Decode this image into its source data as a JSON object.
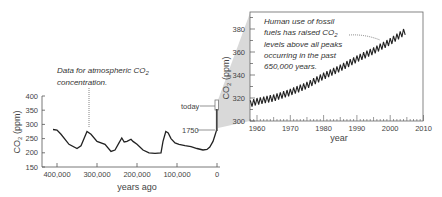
{
  "chart_data": [
    {
      "type": "line",
      "title": "",
      "xlabel": "years ago",
      "ylabel": "CO2 (ppm)",
      "xlim": [
        420000,
        0
      ],
      "ylim": [
        150,
        400
      ],
      "x_ticks": [
        "400,000",
        "300,000",
        "200,000",
        "100,000",
        "0"
      ],
      "y_ticks": [
        "400",
        "350",
        "300",
        "250",
        "200",
        "150"
      ],
      "grid": false,
      "annotation": "Data for atmospheric CO2 concentration.",
      "markers": [
        {
          "label": "today",
          "value": 380
        },
        {
          "label": "1750",
          "value": 280
        }
      ],
      "series": [
        {
          "name": "Atmospheric CO2 (ice core)",
          "x": [
            410000,
            400000,
            390000,
            370000,
            350000,
            340000,
            325000,
            315000,
            300000,
            280000,
            265000,
            255000,
            245000,
            238000,
            232000,
            225000,
            215000,
            210000,
            200000,
            185000,
            170000,
            155000,
            140000,
            135000,
            128000,
            122000,
            115000,
            105000,
            95000,
            80000,
            65000,
            50000,
            35000,
            25000,
            18000,
            10000,
            5000,
            1000,
            0
          ],
          "values": [
            282,
            280,
            265,
            230,
            215,
            225,
            275,
            265,
            240,
            230,
            205,
            210,
            235,
            252,
            238,
            240,
            248,
            240,
            230,
            210,
            200,
            198,
            200,
            240,
            275,
            270,
            250,
            235,
            230,
            225,
            222,
            215,
            210,
            212,
            220,
            240,
            262,
            280,
            280
          ]
        }
      ]
    },
    {
      "type": "line",
      "title": "",
      "xlabel": "year",
      "ylabel": "CO2 (ppm)",
      "xlim": [
        1957,
        2010
      ],
      "ylim": [
        300,
        390
      ],
      "x_ticks": [
        "1960",
        "1970",
        "1980",
        "1990",
        "2000",
        "2010"
      ],
      "y_ticks": [
        "380",
        "360",
        "340",
        "320",
        "300"
      ],
      "grid": false,
      "annotation": "Human use of fossil fuels has raised CO2 levels above all peaks occurring in the past 650,000 years.",
      "series": [
        {
          "name": "Mauna Loa CO2 (seasonal)",
          "x": [
            1958,
            1960,
            1965,
            1970,
            1975,
            1980,
            1985,
            1990,
            1995,
            2000,
            2005
          ],
          "values": [
            315,
            317,
            320,
            325,
            331,
            339,
            346,
            354,
            361,
            369,
            379
          ]
        }
      ]
    }
  ],
  "left_chart": {
    "ylabel": "CO",
    "ylabel_sub": "2",
    "ylabel_unit": " (ppm)",
    "xlabel": "years ago",
    "y_ticks": [
      "400",
      "350",
      "300",
      "250",
      "200",
      "150"
    ],
    "x_ticks": [
      "400,000",
      "300,000",
      "200,000",
      "100,000",
      "0"
    ],
    "annotation_line1": "Data for atmospheric CO",
    "annotation_sub": "2",
    "annotation_line2": "concentration.",
    "marker_today": "today",
    "marker_1750": "1750"
  },
  "right_chart": {
    "ylabel": "CO",
    "ylabel_sub": "2",
    "ylabel_unit": " (ppm)",
    "xlabel": "year",
    "y_ticks": [
      "380",
      "360",
      "340",
      "320",
      "300"
    ],
    "x_ticks": [
      "1960",
      "1970",
      "1980",
      "1990",
      "2000",
      "2010"
    ],
    "annotation_line1": "Human use of fossil",
    "annotation_line2a": "fuels has raised CO",
    "annotation_sub": "2",
    "annotation_line3": "levels above all peaks",
    "annotation_line4": "occurring in the past",
    "annotation_line5": "650,000 years."
  },
  "colors": {
    "line": "#222222",
    "axis": "#555555",
    "wedge": "#d9d9d9"
  }
}
